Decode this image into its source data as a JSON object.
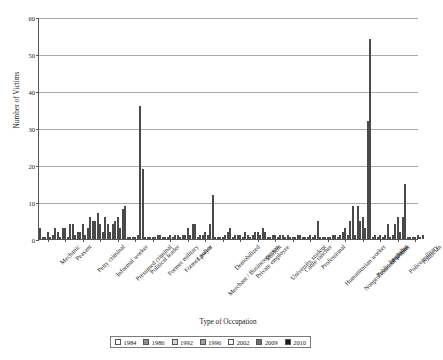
{
  "chart_data": {
    "type": "bar",
    "title": "",
    "xlabel": "Type of Occupation",
    "ylabel": "Number of Victims",
    "ylim": [
      0,
      60
    ],
    "yticks": [
      0,
      10,
      20,
      30,
      40,
      50,
      60
    ],
    "grid": true,
    "legend_position": "bottom",
    "categories": [
      "Mechanic",
      "Peasant",
      "Petty criminal",
      "Informal worker",
      "Presumed criminal",
      "Political leader",
      "Former military",
      "Former police",
      "Lawyer",
      "Merchant / Businessperson",
      "Demobilized",
      "Private employee",
      "Student",
      "University student",
      "Cattle rancher",
      "Professional",
      "Humanitarian worker",
      "Nonprofessional worker",
      "Public employee",
      "Journalist",
      "Police/military",
      "Politician"
    ],
    "series": [
      {
        "name": "1984",
        "color": "#ffffff",
        "values": [
          3,
          2,
          1,
          5,
          2,
          0,
          0,
          0,
          0,
          0,
          0,
          0,
          0,
          0,
          0,
          0,
          0,
          0,
          1,
          0,
          0,
          0
        ]
      },
      {
        "name": "1986",
        "color": "#8f8f8f",
        "values": [
          0,
          0,
          2,
          5,
          4,
          0,
          0,
          0,
          1,
          1,
          0,
          1,
          1,
          0,
          1,
          0,
          0,
          1,
          9,
          1,
          1,
          0
        ]
      },
      {
        "name": "1992",
        "color": "#d8d8d8",
        "values": [
          0,
          3,
          2,
          7,
          5,
          0,
          0,
          0,
          1,
          1,
          0,
          1,
          2,
          1,
          0,
          0,
          0,
          2,
          5,
          0,
          4,
          0
        ]
      },
      {
        "name": "1996",
        "color": "#9e9e9e",
        "values": [
          2,
          3,
          4,
          4,
          6,
          0,
          0,
          1,
          3,
          2,
          0,
          1,
          2,
          1,
          0,
          1,
          0,
          3,
          6,
          1,
          6,
          0
        ]
      },
      {
        "name": "2002",
        "color": "#fafafa",
        "values": [
          0,
          0,
          1,
          2,
          3,
          1,
          0,
          0,
          1,
          1,
          1,
          0,
          1,
          0,
          0,
          0,
          0,
          1,
          3,
          0,
          2,
          1
        ]
      },
      {
        "name": "2009",
        "color": "#6e6e6e",
        "values": [
          1,
          4,
          3,
          6,
          8,
          36,
          1,
          1,
          4,
          4,
          2,
          2,
          3,
          1,
          1,
          1,
          1,
          5,
          32,
          1,
          6,
          0
        ]
      },
      {
        "name": "2010",
        "color": "#1a1a1a",
        "values": [
          3,
          4,
          6,
          4,
          9,
          19,
          1,
          1,
          4,
          12,
          3,
          1,
          2,
          1,
          1,
          5,
          1,
          9,
          54,
          4,
          15,
          1
        ]
      }
    ]
  },
  "legend": {
    "items": [
      {
        "label": "1984",
        "color": "#ffffff"
      },
      {
        "label": "1986",
        "color": "#8f8f8f"
      },
      {
        "label": "1992",
        "color": "#d8d8d8"
      },
      {
        "label": "1996",
        "color": "#9e9e9e"
      },
      {
        "label": "2002",
        "color": "#fafafa"
      },
      {
        "label": "2009",
        "color": "#6e6e6e"
      },
      {
        "label": "2010",
        "color": "#1a1a1a"
      }
    ]
  }
}
